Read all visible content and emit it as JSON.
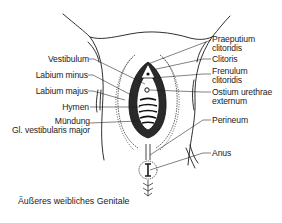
{
  "figure": {
    "caption": "Äußeres weibliches Genitale",
    "line_color": "#1a1a1a",
    "text_color": "#222222"
  },
  "labels_left": [
    {
      "id": "vestibulum",
      "text": "Vestibulum"
    },
    {
      "id": "labium-minus",
      "text": "Labium minus"
    },
    {
      "id": "labium-majus",
      "text": "Labium majus"
    },
    {
      "id": "hymen",
      "text": "Hymen"
    },
    {
      "id": "muendung",
      "line1": "Mündung",
      "line2": "Gl. vestibularis major"
    }
  ],
  "labels_right": [
    {
      "id": "praeputium-clitoridis",
      "line1": "Praeputium",
      "line2": "clitoridis"
    },
    {
      "id": "clitoris",
      "text": "Clitoris"
    },
    {
      "id": "frenulum-clitoridis",
      "line1": "Frenulum",
      "line2": "clitoridis"
    },
    {
      "id": "ostium-urethrae-externum",
      "line1": "Ostium urethrae",
      "line2": "externum"
    },
    {
      "id": "perineum",
      "text": "Perineum"
    },
    {
      "id": "anus",
      "text": "Anus"
    }
  ]
}
